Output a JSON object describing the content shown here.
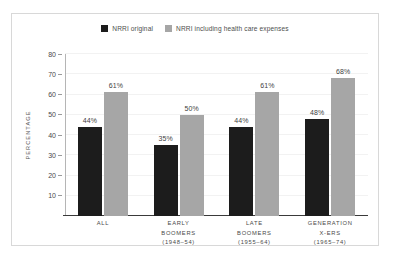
{
  "chart_data": {
    "type": "bar",
    "title": "",
    "xlabel": "",
    "ylabel": "PERCENTAGE",
    "ylim": [
      0,
      80
    ],
    "yticks": [
      10,
      20,
      30,
      40,
      50,
      60,
      70,
      80
    ],
    "grid": true,
    "legend_position": "top-center",
    "categories": [
      "ALL",
      "EARLY BOOMERS (1948–54)",
      "LATE BOOMERS (1955–64)",
      "GENERATION X-ERS (1965–74)"
    ],
    "category_lines": [
      [
        "ALL"
      ],
      [
        "EARLY",
        "BOOMERS",
        "(1948–54)"
      ],
      [
        "LATE",
        "BOOMERS",
        "(1955–64)"
      ],
      [
        "GENERATION",
        "X-ERS",
        "(1965–74)"
      ]
    ],
    "series": [
      {
        "name": "NRRI original",
        "color": "#1c1c1c",
        "values": [
          44,
          35,
          44,
          48
        ],
        "labels": [
          "44%",
          "35%",
          "44%",
          "48%"
        ]
      },
      {
        "name": "NRRI including health care expenses",
        "color": "#a6a6a6",
        "values": [
          61,
          50,
          61,
          68
        ],
        "labels": [
          "61%",
          "50%",
          "61%",
          "68%"
        ]
      }
    ]
  },
  "legend": {
    "entries": [
      {
        "label": "NRRI original",
        "color": "#1c1c1c"
      },
      {
        "label": "NRRI including health care expenses",
        "color": "#a6a6a6"
      }
    ]
  },
  "colors": {
    "frame": "#d8d8d8",
    "axis": "#b5b5b5",
    "baseline": "#3a3a3a",
    "grid": "#f2f2f2",
    "text": "#4a4a4a",
    "background": "#ffffff"
  }
}
